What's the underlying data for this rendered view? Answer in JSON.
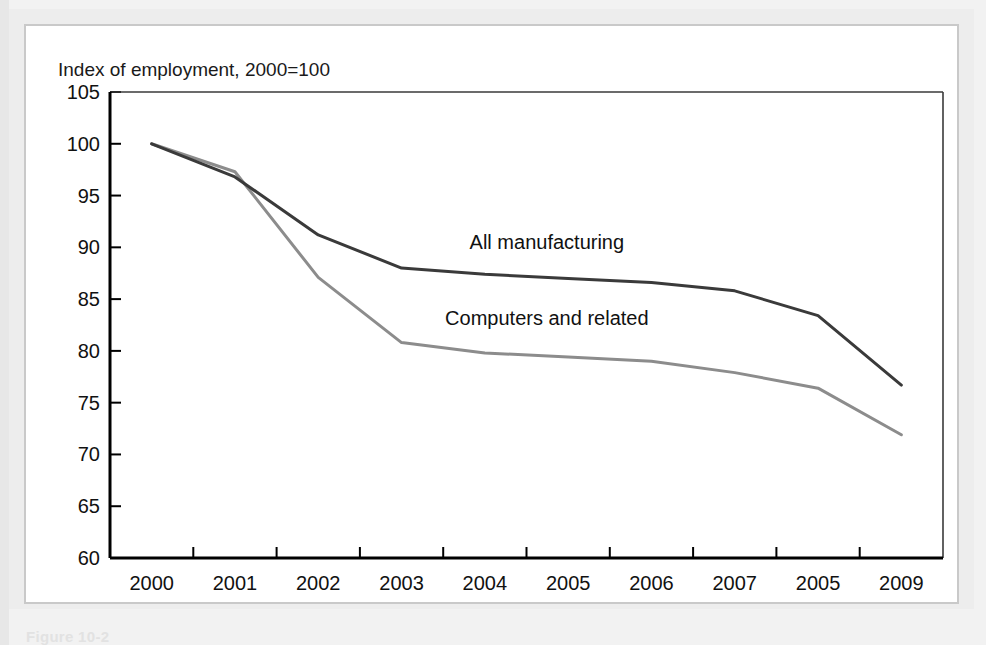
{
  "figure": {
    "axis_title": "Index of employment, 2000=100",
    "caption_partial": "Figure 10-2"
  },
  "colors": {
    "all_manufacturing_line": "#3a3a3a",
    "computers_line": "#8c8c8c",
    "axis": "#000000",
    "page_background": "#f2f2f2",
    "figure_background": "#ffffff",
    "figure_border": "#c9c9c9"
  },
  "chart_data": {
    "type": "line",
    "title": "",
    "subtitle": "",
    "xlabel": "",
    "ylabel": "Index of employment, 2000=100",
    "categories": [
      "2000",
      "2001",
      "2002",
      "2003",
      "2004",
      "2005",
      "2006",
      "2007",
      "2005",
      "2009"
    ],
    "ylim": [
      60,
      105
    ],
    "yticks": [
      60,
      65,
      70,
      75,
      80,
      85,
      90,
      95,
      100,
      105
    ],
    "grid": false,
    "legend_position": "inline-annotation",
    "series": [
      {
        "name": "All manufacturing",
        "color": "#3a3a3a",
        "values": [
          100.0,
          96.8,
          91.2,
          88.0,
          87.4,
          87.0,
          86.6,
          85.8,
          83.4,
          76.7
        ],
        "label_x_category": "2004",
        "label_value": 89.8
      },
      {
        "name": "Computers and related",
        "color": "#8c8c8c",
        "values": [
          100.0,
          97.3,
          87.1,
          80.8,
          79.8,
          79.4,
          79.0,
          77.9,
          76.4,
          71.9
        ],
        "label_x_category": "2004",
        "label_value": 82.5
      }
    ]
  }
}
